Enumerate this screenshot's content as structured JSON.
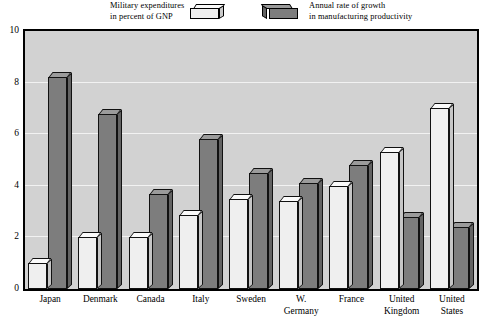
{
  "chart_data": {
    "type": "bar",
    "title": "",
    "subtitle": "",
    "xlabel": "",
    "ylabel": "",
    "ylim": [
      0,
      10
    ],
    "yticks": [
      0,
      2,
      4,
      6,
      8,
      10
    ],
    "grid": true,
    "legend_position": "top",
    "categories": [
      "Japan",
      "Denmark",
      "Canada",
      "Italy",
      "Sweden",
      "W. Germany",
      "France",
      "United Kingdom",
      "United States"
    ],
    "category_lines": [
      [
        "Japan"
      ],
      [
        "Denmark"
      ],
      [
        "Canada"
      ],
      [
        "Italy"
      ],
      [
        "Sweden"
      ],
      [
        "W.",
        "Germany"
      ],
      [
        "France"
      ],
      [
        "United",
        "Kingdom"
      ],
      [
        "United",
        "States"
      ]
    ],
    "series": [
      {
        "name": "Military expenditures in percent of GNP",
        "name_lines": [
          "Military expenditures",
          "in percent of GNP"
        ],
        "color": "#efefef",
        "values": [
          1.0,
          2.0,
          2.0,
          2.85,
          3.5,
          3.4,
          4.0,
          5.3,
          7.0
        ]
      },
      {
        "name": "Annual rate of growth in manufacturing productivity",
        "name_lines": [
          "Annual rate of growth",
          "in manufacturing productivity"
        ],
        "color": "#7d7d7d",
        "values": [
          8.2,
          6.8,
          3.7,
          5.8,
          4.5,
          4.1,
          4.8,
          2.8,
          2.4
        ]
      }
    ]
  },
  "colors": {
    "plot_background": "#d2d2d2",
    "gridline": "#f2f2f2",
    "frame": "#000000",
    "light_bar": "#efefef",
    "dark_bar": "#7d7d7d",
    "page_background": "#ffffff"
  }
}
